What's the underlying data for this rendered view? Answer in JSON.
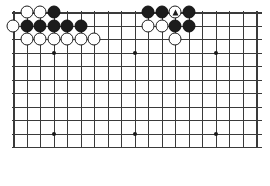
{
  "page": {
    "background_color": "#ffffff"
  },
  "board": {
    "type": "go-board",
    "description": "Partial (top-cropped) 19x19 Go board diagram showing a joseki / capturing-race position in the upper area",
    "columns": 19,
    "visible_rows": 11,
    "line_color": "#3a3a3a",
    "black_color": "#1c1c1c",
    "white_color": "#ffffff",
    "geometry": {
      "left": 12,
      "top": 11,
      "width": 250,
      "height": 136,
      "col_spacing": 13.5,
      "row_spacing": 13.5
    },
    "star_points": [
      {
        "col": 4,
        "row": 4
      },
      {
        "col": 10,
        "row": 4
      },
      {
        "col": 16,
        "row": 4
      },
      {
        "col": 4,
        "row": 10
      },
      {
        "col": 10,
        "row": 10
      },
      {
        "col": 16,
        "row": 10
      }
    ],
    "stones": [
      {
        "col": 2,
        "row": 1,
        "color": "white",
        "mark": ""
      },
      {
        "col": 3,
        "row": 1,
        "color": "white",
        "mark": ""
      },
      {
        "col": 4,
        "row": 1,
        "color": "black",
        "mark": ""
      },
      {
        "col": 11,
        "row": 1,
        "color": "black",
        "mark": ""
      },
      {
        "col": 12,
        "row": 1,
        "color": "black",
        "mark": ""
      },
      {
        "col": 13,
        "row": 1,
        "color": "white",
        "mark": "triangle"
      },
      {
        "col": 14,
        "row": 1,
        "color": "black",
        "mark": ""
      },
      {
        "col": 1,
        "row": 2,
        "color": "white",
        "mark": ""
      },
      {
        "col": 2,
        "row": 2,
        "color": "black",
        "mark": ""
      },
      {
        "col": 3,
        "row": 2,
        "color": "black",
        "mark": ""
      },
      {
        "col": 4,
        "row": 2,
        "color": "black",
        "mark": ""
      },
      {
        "col": 5,
        "row": 2,
        "color": "black",
        "mark": ""
      },
      {
        "col": 6,
        "row": 2,
        "color": "black",
        "mark": ""
      },
      {
        "col": 11,
        "row": 2,
        "color": "white",
        "mark": ""
      },
      {
        "col": 12,
        "row": 2,
        "color": "white",
        "mark": ""
      },
      {
        "col": 13,
        "row": 2,
        "color": "black",
        "mark": ""
      },
      {
        "col": 14,
        "row": 2,
        "color": "black",
        "mark": ""
      },
      {
        "col": 2,
        "row": 3,
        "color": "white",
        "mark": ""
      },
      {
        "col": 3,
        "row": 3,
        "color": "white",
        "mark": ""
      },
      {
        "col": 4,
        "row": 3,
        "color": "white",
        "mark": ""
      },
      {
        "col": 5,
        "row": 3,
        "color": "white",
        "mark": ""
      },
      {
        "col": 6,
        "row": 3,
        "color": "white",
        "mark": ""
      },
      {
        "col": 7,
        "row": 3,
        "color": "white",
        "mark": ""
      },
      {
        "col": 13,
        "row": 3,
        "color": "white",
        "mark": ""
      }
    ]
  },
  "caption": {
    "broken_image_icon": "broken-image-icon",
    "rule_color": "#6e6e6e"
  }
}
